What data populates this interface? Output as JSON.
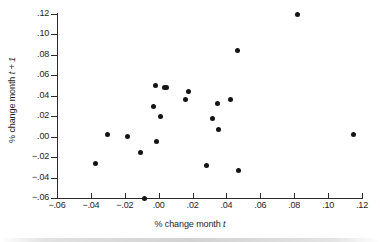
{
  "chart_data": {
    "type": "scatter",
    "title": "",
    "xlabel": "% change month t",
    "ylabel": "% change month t + 1",
    "xlim": [
      -0.06,
      0.12
    ],
    "ylim": [
      -0.06,
      0.12
    ],
    "xticks": [
      -0.06,
      -0.04,
      -0.02,
      0.0,
      0.02,
      0.04,
      0.06,
      0.08,
      0.1,
      0.12
    ],
    "yticks": [
      -0.06,
      -0.04,
      -0.02,
      0.0,
      0.02,
      0.04,
      0.06,
      0.08,
      0.1,
      0.12
    ],
    "xticklabels": [
      "−.06",
      "−.04",
      "−.02",
      ".00",
      ".02",
      ".04",
      ".06",
      ".08",
      ".10",
      ".12"
    ],
    "yticklabels": [
      "−.06",
      "−.04",
      "−.02",
      ".00",
      ".02",
      ".04",
      ".06",
      ".08",
      ".10",
      ".12"
    ],
    "grid": false,
    "legend": null,
    "marker": "filled-circle",
    "marker_color": "#141414",
    "points": [
      {
        "x": -0.0375,
        "y": -0.0262
      },
      {
        "x": -0.03,
        "y": 0.0025
      },
      {
        "x": -0.0185,
        "y": 0.0002
      },
      {
        "x": -0.0105,
        "y": -0.0155
      },
      {
        "x": -0.0085,
        "y": -0.06
      },
      {
        "x": -0.0028,
        "y": 0.0293
      },
      {
        "x": -0.002,
        "y": 0.0497
      },
      {
        "x": -0.001,
        "y": -0.0048
      },
      {
        "x": 0.0012,
        "y": 0.0193
      },
      {
        "x": 0.0032,
        "y": 0.0478
      },
      {
        "x": 0.0048,
        "y": 0.0477
      },
      {
        "x": 0.0158,
        "y": 0.0367
      },
      {
        "x": 0.0178,
        "y": 0.0443
      },
      {
        "x": 0.0282,
        "y": -0.0283
      },
      {
        "x": 0.0318,
        "y": 0.0177
      },
      {
        "x": 0.0348,
        "y": 0.0322
      },
      {
        "x": 0.0355,
        "y": 0.0072
      },
      {
        "x": 0.0425,
        "y": 0.0365
      },
      {
        "x": 0.0465,
        "y": 0.084
      },
      {
        "x": 0.0473,
        "y": -0.0333
      },
      {
        "x": 0.0818,
        "y": 0.12
      },
      {
        "x": 0.1152,
        "y": 0.0025
      }
    ]
  }
}
